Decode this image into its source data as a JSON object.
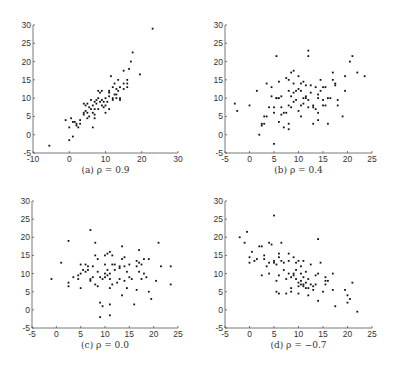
{
  "chart_data": [
    {
      "type": "scatter",
      "title": "",
      "caption": "(a) ρ = 0.9",
      "xlabel": "",
      "ylabel": "",
      "xlim": [
        -10,
        30
      ],
      "ylim": [
        -5,
        30
      ],
      "xticks": [
        -10,
        0,
        10,
        20,
        30
      ],
      "yticks": [
        -5,
        0,
        5,
        10,
        15,
        20,
        25,
        30
      ],
      "grid": false,
      "box": [
        33,
        25,
        178,
        153
      ],
      "points": [
        [
          -5.5,
          -3
        ],
        [
          -1,
          4
        ],
        [
          0,
          2
        ],
        [
          0,
          -1.5
        ],
        [
          0.5,
          4.5
        ],
        [
          1,
          3.5
        ],
        [
          1,
          -0.5
        ],
        [
          1.5,
          3.5
        ],
        [
          2,
          2.5
        ],
        [
          2,
          3
        ],
        [
          2.5,
          2
        ],
        [
          3,
          4
        ],
        [
          3,
          3
        ],
        [
          4,
          5.5
        ],
        [
          4,
          6
        ],
        [
          4,
          8.5
        ],
        [
          4.5,
          6.5
        ],
        [
          4.5,
          8
        ],
        [
          5,
          6
        ],
        [
          5,
          4.5
        ],
        [
          5,
          8.5
        ],
        [
          5.5,
          5
        ],
        [
          5.5,
          7.5
        ],
        [
          6,
          7
        ],
        [
          6,
          9.5
        ],
        [
          6.5,
          6
        ],
        [
          6.5,
          8
        ],
        [
          6.5,
          2
        ],
        [
          7,
          4.5
        ],
        [
          7,
          5.5
        ],
        [
          7,
          7
        ],
        [
          7,
          9
        ],
        [
          7.5,
          9.5
        ],
        [
          7.5,
          8.5
        ],
        [
          8,
          10
        ],
        [
          8,
          12
        ],
        [
          8,
          7
        ],
        [
          8.5,
          9
        ],
        [
          8.5,
          11.5
        ],
        [
          9,
          9.5
        ],
        [
          9,
          8
        ],
        [
          9,
          12
        ],
        [
          9.5,
          9
        ],
        [
          9.5,
          7.5
        ],
        [
          10,
          8
        ],
        [
          10,
          10
        ],
        [
          10,
          6
        ],
        [
          10.5,
          9
        ],
        [
          11,
          12
        ],
        [
          11,
          10.5
        ],
        [
          11,
          11.5
        ],
        [
          11,
          7
        ],
        [
          11.5,
          16
        ],
        [
          12,
          10
        ],
        [
          12,
          13
        ],
        [
          12,
          9.5
        ],
        [
          12.5,
          11
        ],
        [
          12.5,
          14
        ],
        [
          13,
          11
        ],
        [
          13,
          12.5
        ],
        [
          13,
          10
        ],
        [
          13.5,
          12
        ],
        [
          13.5,
          15
        ],
        [
          14,
          10
        ],
        [
          14,
          13
        ],
        [
          14,
          9.5
        ],
        [
          15,
          14
        ],
        [
          15,
          12.5
        ],
        [
          15,
          17.5
        ],
        [
          16,
          14
        ],
        [
          16,
          15
        ],
        [
          16,
          13
        ],
        [
          16.5,
          18
        ],
        [
          17,
          20
        ],
        [
          17.5,
          22.5
        ],
        [
          19.5,
          16.5
        ],
        [
          23,
          29
        ]
      ]
    },
    {
      "type": "scatter",
      "title": "",
      "caption": "(b) ρ = 0.4",
      "xlabel": "",
      "ylabel": "",
      "xlim": [
        -5,
        25
      ],
      "ylim": [
        -5,
        30
      ],
      "xticks": [
        -5,
        0,
        5,
        10,
        15,
        20,
        25
      ],
      "yticks": [
        -5,
        0,
        5,
        10,
        15,
        20,
        25,
        30
      ],
      "grid": false,
      "box": [
        225,
        25,
        372,
        153
      ],
      "points": [
        [
          -3,
          8.5
        ],
        [
          -2.5,
          6.5
        ],
        [
          0,
          8
        ],
        [
          1.5,
          12
        ],
        [
          2,
          0
        ],
        [
          2.5,
          3
        ],
        [
          2.5,
          2.5
        ],
        [
          3,
          3
        ],
        [
          3,
          5
        ],
        [
          3.5,
          14
        ],
        [
          3.5,
          5
        ],
        [
          4,
          7.5
        ],
        [
          4.5,
          13
        ],
        [
          4.5,
          10.5
        ],
        [
          5,
          -2.5
        ],
        [
          5,
          7.5
        ],
        [
          5,
          6
        ],
        [
          5.5,
          10
        ],
        [
          5.5,
          21.5
        ],
        [
          5.5,
          10
        ],
        [
          6,
          3.5
        ],
        [
          6,
          10
        ],
        [
          6,
          14.5
        ],
        [
          6.5,
          5.5
        ],
        [
          6.5,
          7.5
        ],
        [
          6.5,
          10.5
        ],
        [
          7,
          6
        ],
        [
          7,
          2
        ],
        [
          7.5,
          6
        ],
        [
          7.5,
          15.5
        ],
        [
          8,
          12
        ],
        [
          8,
          15
        ],
        [
          8,
          3
        ],
        [
          8,
          8
        ],
        [
          8,
          1.5
        ],
        [
          8.5,
          17
        ],
        [
          8.5,
          7.5
        ],
        [
          8.5,
          10.5
        ],
        [
          9,
          17.5
        ],
        [
          9,
          9
        ],
        [
          9,
          11.5
        ],
        [
          9,
          14
        ],
        [
          9.5,
          12
        ],
        [
          9.5,
          9.5
        ],
        [
          10,
          12.5
        ],
        [
          10,
          6.5
        ],
        [
          10,
          16
        ],
        [
          10.5,
          5
        ],
        [
          10.5,
          8
        ],
        [
          10.5,
          12
        ],
        [
          10.5,
          14
        ],
        [
          11,
          8.5
        ],
        [
          11,
          14.5
        ],
        [
          11,
          10
        ],
        [
          11.5,
          10.5
        ],
        [
          11.5,
          10
        ],
        [
          11.5,
          13.5
        ],
        [
          12,
          23
        ],
        [
          12,
          21.5
        ],
        [
          12,
          7.5
        ],
        [
          12,
          9.5
        ],
        [
          12.5,
          13.5
        ],
        [
          12.5,
          11.5
        ],
        [
          13,
          7.5
        ],
        [
          13,
          8
        ],
        [
          13,
          3
        ],
        [
          13.5,
          13
        ],
        [
          13.5,
          7
        ],
        [
          14,
          10
        ],
        [
          14,
          11
        ],
        [
          14,
          4
        ],
        [
          14,
          6
        ],
        [
          14.5,
          15
        ],
        [
          14.5,
          12
        ],
        [
          15,
          13
        ],
        [
          15,
          8
        ],
        [
          15,
          9.5
        ],
        [
          15.5,
          8
        ],
        [
          15.5,
          13
        ],
        [
          16,
          10
        ],
        [
          16,
          3
        ],
        [
          16.5,
          10
        ],
        [
          17,
          15
        ],
        [
          17,
          17
        ],
        [
          17.5,
          13.5
        ],
        [
          17.5,
          14
        ],
        [
          18,
          9.5
        ],
        [
          18,
          8
        ],
        [
          19,
          5
        ],
        [
          19.5,
          16
        ],
        [
          19.5,
          12
        ],
        [
          20.5,
          20
        ],
        [
          21,
          21.5
        ],
        [
          22,
          17
        ],
        [
          23.5,
          16
        ]
      ]
    },
    {
      "type": "scatter",
      "title": "",
      "caption": "(c) ρ = 0.0",
      "xlabel": "",
      "ylabel": "",
      "xlim": [
        -5,
        25
      ],
      "ylim": [
        -5,
        30
      ],
      "xticks": [
        -5,
        0,
        5,
        10,
        15,
        20,
        25
      ],
      "yticks": [
        -5,
        0,
        5,
        10,
        15,
        20,
        25,
        30
      ],
      "grid": false,
      "box": [
        32,
        201,
        178,
        328
      ],
      "points": [
        [
          -1,
          8.5
        ],
        [
          1,
          13
        ],
        [
          2.5,
          19
        ],
        [
          2.5,
          7.5
        ],
        [
          2.5,
          6.5
        ],
        [
          3.5,
          9
        ],
        [
          4.5,
          9.5
        ],
        [
          4.5,
          8.5
        ],
        [
          5,
          6
        ],
        [
          5,
          12.5
        ],
        [
          5,
          10
        ],
        [
          5.5,
          11
        ],
        [
          6,
          12.5
        ],
        [
          6,
          10.5
        ],
        [
          6.5,
          12
        ],
        [
          6.5,
          11
        ],
        [
          7,
          8.5
        ],
        [
          7,
          22
        ],
        [
          7,
          8
        ],
        [
          7.5,
          9
        ],
        [
          7.5,
          12
        ],
        [
          8,
          18.5
        ],
        [
          8,
          7
        ],
        [
          8,
          15
        ],
        [
          8.5,
          10.5
        ],
        [
          8.5,
          14
        ],
        [
          8.5,
          6.5
        ],
        [
          9,
          2
        ],
        [
          9,
          -2
        ],
        [
          9,
          9
        ],
        [
          9.5,
          8.5
        ],
        [
          9.5,
          1
        ],
        [
          10,
          10
        ],
        [
          10,
          15
        ],
        [
          10,
          12.5
        ],
        [
          10,
          9
        ],
        [
          10.5,
          9.5
        ],
        [
          10.5,
          15.5
        ],
        [
          10.5,
          11
        ],
        [
          11,
          16
        ],
        [
          11,
          10
        ],
        [
          11,
          8.5
        ],
        [
          11,
          6
        ],
        [
          11,
          1.5
        ],
        [
          11,
          -1.5
        ],
        [
          11.5,
          12.5
        ],
        [
          11.5,
          15
        ],
        [
          11.5,
          7
        ],
        [
          12,
          12.5
        ],
        [
          12,
          11
        ],
        [
          12.5,
          7.5
        ],
        [
          13,
          12
        ],
        [
          13,
          8.5
        ],
        [
          13,
          11.5
        ],
        [
          13.5,
          17.5
        ],
        [
          13.5,
          14
        ],
        [
          13.5,
          4
        ],
        [
          14,
          12
        ],
        [
          14,
          8
        ],
        [
          14,
          14.5
        ],
        [
          14.5,
          6
        ],
        [
          14.5,
          10.5
        ],
        [
          15,
          12.5
        ],
        [
          15,
          9
        ],
        [
          15.5,
          8.5
        ],
        [
          16,
          1.5
        ],
        [
          16.5,
          13.5
        ],
        [
          16.5,
          5.5
        ],
        [
          16.5,
          12
        ],
        [
          17,
          13
        ],
        [
          17,
          10.5
        ],
        [
          17,
          16.5
        ],
        [
          17.5,
          12.5
        ],
        [
          17.5,
          8.5
        ],
        [
          18,
          14
        ],
        [
          18,
          10
        ],
        [
          18.5,
          9
        ],
        [
          19,
          5
        ],
        [
          19,
          14
        ],
        [
          19.5,
          3
        ],
        [
          20.5,
          8
        ],
        [
          21,
          18.5
        ],
        [
          21.5,
          12
        ],
        [
          23.5,
          12
        ],
        [
          23.5,
          7
        ]
      ]
    },
    {
      "type": "scatter",
      "title": "",
      "caption": "(d) ρ = −0.7",
      "xlabel": "",
      "ylabel": "",
      "xlim": [
        -5,
        25
      ],
      "ylim": [
        -5,
        30
      ],
      "xticks": [
        -5,
        0,
        5,
        10,
        15,
        20,
        25
      ],
      "yticks": [
        -5,
        0,
        5,
        10,
        15,
        20,
        25,
        30
      ],
      "grid": false,
      "box": [
        225,
        201,
        372,
        328
      ],
      "points": [
        [
          -2,
          20
        ],
        [
          -1,
          18.5
        ],
        [
          -0.5,
          21.5
        ],
        [
          0,
          14.5
        ],
        [
          0,
          13
        ],
        [
          0.5,
          16
        ],
        [
          1,
          13.5
        ],
        [
          1.5,
          14
        ],
        [
          2,
          17.5
        ],
        [
          2.5,
          17.5
        ],
        [
          2.5,
          9.5
        ],
        [
          3,
          15
        ],
        [
          3,
          14
        ],
        [
          3.5,
          12
        ],
        [
          4,
          13
        ],
        [
          4,
          18.5
        ],
        [
          4,
          10
        ],
        [
          4.5,
          18
        ],
        [
          5,
          13.5
        ],
        [
          5,
          13
        ],
        [
          5,
          26
        ],
        [
          5.5,
          12.5
        ],
        [
          5.5,
          8
        ],
        [
          5.5,
          5
        ],
        [
          6,
          15.5
        ],
        [
          6,
          14.5
        ],
        [
          6,
          9.5
        ],
        [
          6,
          4.5
        ],
        [
          6.5,
          13.5
        ],
        [
          6.5,
          18.5
        ],
        [
          7,
          13
        ],
        [
          7,
          11
        ],
        [
          7.5,
          8.5
        ],
        [
          7.5,
          4.5
        ],
        [
          8,
          13.5
        ],
        [
          8,
          15.5
        ],
        [
          8,
          10
        ],
        [
          8.5,
          9
        ],
        [
          8.5,
          6
        ],
        [
          8.5,
          5
        ],
        [
          9,
          14.5
        ],
        [
          9,
          9.5
        ],
        [
          9,
          10
        ],
        [
          9.5,
          13
        ],
        [
          9.5,
          11
        ],
        [
          9.5,
          8.5
        ],
        [
          10,
          13.5
        ],
        [
          10,
          6.5
        ],
        [
          10,
          4.5
        ],
        [
          10,
          7.5
        ],
        [
          10.5,
          10
        ],
        [
          10.5,
          8
        ],
        [
          10.5,
          7
        ],
        [
          10.5,
          12
        ],
        [
          11,
          9
        ],
        [
          11,
          6.5
        ],
        [
          11,
          7
        ],
        [
          11,
          13.5
        ],
        [
          11.5,
          10.5
        ],
        [
          11.5,
          6
        ],
        [
          11.5,
          7.5
        ],
        [
          12,
          4
        ],
        [
          12,
          8.5
        ],
        [
          12,
          6
        ],
        [
          12.5,
          12.5
        ],
        [
          12.5,
          7
        ],
        [
          13,
          6.5
        ],
        [
          13,
          5.5
        ],
        [
          13.5,
          7
        ],
        [
          13.5,
          9.5
        ],
        [
          14,
          10
        ],
        [
          14,
          2.5
        ],
        [
          14,
          19.5
        ],
        [
          14.5,
          13
        ],
        [
          15,
          5
        ],
        [
          15.5,
          8
        ],
        [
          15.5,
          9
        ],
        [
          15.5,
          7
        ],
        [
          16,
          8
        ],
        [
          17,
          10
        ],
        [
          17,
          5.5
        ],
        [
          17.5,
          1
        ],
        [
          19.5,
          5.5
        ],
        [
          20,
          4
        ],
        [
          20,
          2
        ],
        [
          20.5,
          3
        ],
        [
          21,
          7.5
        ],
        [
          22,
          -0.5
        ]
      ]
    }
  ]
}
